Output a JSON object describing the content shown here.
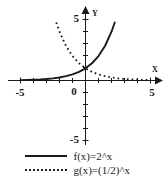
{
  "chart_data": {
    "type": "line",
    "title": "",
    "xlabel": "X",
    "ylabel": "Y",
    "xlim": [
      -5,
      5
    ],
    "ylim": [
      -5,
      5
    ],
    "grid": false,
    "legend_position": "bottom",
    "x_tick_labels": [
      "-5",
      "0",
      "5"
    ],
    "y_tick_labels": [
      "5",
      "-5"
    ],
    "tick_step": 1,
    "series": [
      {
        "name": "f(x)=2^x",
        "style": "solid",
        "color": "#1a1a1a",
        "x": [
          -5,
          -4.5,
          -4,
          -3.5,
          -3,
          -2.5,
          -2,
          -1.5,
          -1,
          -0.5,
          0,
          0.5,
          1,
          1.5,
          2,
          2.25
        ],
        "values": [
          0.031,
          0.044,
          0.063,
          0.088,
          0.125,
          0.177,
          0.25,
          0.354,
          0.5,
          0.707,
          1,
          1.414,
          2,
          2.828,
          4,
          4.757
        ]
      },
      {
        "name": "g(x)=(1/2)^x",
        "style": "dotted",
        "color": "#1a1a1a",
        "x": [
          -2.25,
          -2,
          -1.5,
          -1,
          -0.5,
          0,
          0.5,
          1,
          1.5,
          2,
          2.5,
          3,
          3.5,
          4,
          4.5,
          5
        ],
        "values": [
          4.757,
          4,
          2.828,
          2,
          1.414,
          1,
          0.707,
          0.5,
          0.354,
          0.25,
          0.177,
          0.125,
          0.088,
          0.063,
          0.044,
          0.031
        ]
      }
    ]
  },
  "axes": {
    "x_label": "X",
    "y_label": "Y",
    "origin_label": "0",
    "x_min_label": "-5",
    "x_max_label": "5",
    "y_max_label": "5",
    "y_min_label": "-5"
  },
  "legend": {
    "items": [
      {
        "key": "solid-line-key",
        "label": "f(x)=2^x"
      },
      {
        "key": "dotted-line-key",
        "label": "g(x)=(1/2)^x"
      }
    ]
  },
  "colors": {
    "ink": "#1a1a1a",
    "background": "#ffffff"
  }
}
